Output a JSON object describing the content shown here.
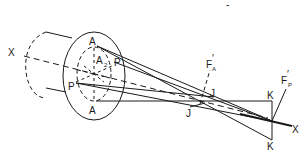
{
  "diagram": {
    "type": "optics-astigmatism-lens-ray-diagram",
    "colors": {
      "line": "#1a1a1a",
      "background": "#ffffff"
    },
    "labels": {
      "axis_left": "X",
      "axis_right": "X",
      "a_top": "A",
      "a_bottom": "A",
      "a2": "A",
      "a2_sub": "2",
      "p_right": "P",
      "p_left": "P",
      "fa": "F",
      "fa_prime": "′",
      "fa_sub": "A",
      "fp": "F",
      "fp_prime": "′",
      "fp_sub": "P",
      "j_upper": "J",
      "j_lower": "J",
      "k_top": "K",
      "k_bottom": "K",
      "top_mark": "-"
    }
  }
}
